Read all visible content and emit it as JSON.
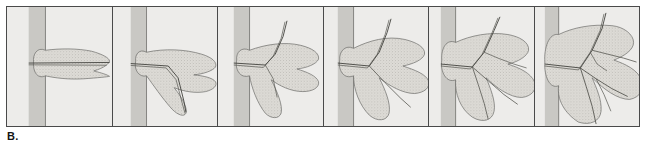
{
  "figure": {
    "caption_label": "B.",
    "panel_count": 6,
    "colors": {
      "frame_border": "#4a4a4a",
      "panel_background": "#edecea",
      "wall_band": "#c9c8c4",
      "deposit_fill": "#dcdbd6",
      "outline": "#6b6b68",
      "channel": "#55554f",
      "caption_text": "#141414"
    }
  },
  "panels": [
    {
      "index": 1,
      "name": "stage-1",
      "wall": {
        "x": 22,
        "width": 17
      },
      "outline": "M39,52 L45,50 L56,47 L70,45 L86,44 L99,44.5 L104,46 L100,48 L92,50 L80,52 L66,55 L52,57 L42,58 L39,58 Z M39,58 L46,60 L58,63 L74,66 L88,68 L99,69 L104,70.5 L98,72 L86,73 L72,73 L58,71 L46,67 L39,63 Z",
      "lobe": "M39,44 C30,40 26,49 27,56 C26,64 30,74 39,70 C48,72 62,74 78,73 C92,72 102,71 104,70.5 C102,69 96,67 88,65 C99,62 104,57 104,55 C104,52 97,48 86,45 C72,42 54,42 39,44 Z",
      "channels": [
        "M24,57 L104,56.5",
        "M24,58.5 L100,59"
      ],
      "wall_line": "M39,10 L39,118"
    },
    {
      "index": 2,
      "name": "stage-2",
      "wall": {
        "x": 18,
        "width": 16
      },
      "outline": "",
      "lobe": "M34,46 C27,42 22,48 23,55 C21,63 26,72 34,70 C40,78 50,93 60,104 C66,110 72,112 74,108 C76,103 70,92 62,82 C72,86 84,88 94,86 C102,84 106,80 104,76 C101,72 92,70 82,69 C92,68 101,65 104,61 C106,56 100,51 90,48 C74,43 52,42 34,46 Z",
      "channels": [
        "M20,58 L56,60 L66,72 L72,96 L74,107",
        "M20,59.5 L54,62 L64,74 L70,97 L73,108"
      ],
      "wall_line": "M34,10 L34,118"
    },
    {
      "index": 3,
      "name": "stage-3",
      "wall": {
        "x": 16,
        "width": 16
      },
      "outline": "",
      "lobe": "M32,44 C24,40 18,46 19,54 C17,63 22,73 32,70 C34,82 40,98 48,108 C54,114 62,114 64,108 C66,100 60,86 54,74 C62,80 74,86 86,86 C96,86 103,82 102,76 C100,70 90,66 80,63 C90,62 100,58 102,53 C103,47 96,42 84,39 C68,35 48,38 32,44 Z",
      "channels": [
        "M18,57 L48,59 L58,48 L66,30 L70,20",
        "M18,59 L46,61 L56,50 L64,32 L68,21",
        "M48,59 L56,72 L60,90"
      ],
      "wall_line": "M32,10 L32,118"
    },
    {
      "index": 4,
      "name": "stage-4",
      "wall": {
        "x": 14,
        "width": 16
      },
      "outline": "",
      "lobe": "M30,42 C22,38 15,45 16,54 C14,64 20,74 30,70 C30,84 36,100 46,110 C54,117 64,116 66,108 C68,98 62,84 56,72 C66,80 80,88 92,88 C102,87 108,82 106,75 C103,68 92,64 80,60 C90,58 100,54 102,48 C103,41 94,36 82,33 C64,29 46,34 30,42 Z",
      "channels": [
        "M16,57 L46,60 L56,46 L64,26 L68,16",
        "M16,59 L44,62 L54,48 L62,28 L66,17",
        "M46,60 L62,76 L76,92 L86,100"
      ],
      "wall_line": "M30,10 L30,118"
    },
    {
      "index": 5,
      "name": "stage-5",
      "wall": {
        "x": 12,
        "width": 15
      },
      "outline": "",
      "lobe": "M27,36 C18,32 12,42 13,54 C11,66 18,78 27,74 C26,88 32,104 44,112 C54,118 64,116 66,106 C68,96 62,82 58,72 C68,82 82,92 94,92 C104,91 110,84 107,76 C103,67 92,62 80,58 C90,56 100,50 101,44 C102,36 92,30 80,28 C62,25 42,29 27,36 Z",
      "channels": [
        "M14,58 L44,61 L56,46 L66,24 L72,14",
        "M14,60 L42,63 L54,48 L64,26 L70,15",
        "M44,61 L60,74 L76,88 L88,98",
        "M44,61 L50,78 L56,96 L60,110",
        "M56,46 L70,52 L84,58 L96,62"
      ],
      "wall_line": "M27,10 L27,118"
    },
    {
      "index": 6,
      "name": "stage-6",
      "wall": {
        "x": 10,
        "width": 14
      },
      "outline": "",
      "lobe": "M24,30 C14,28 9,42 10,56 C9,70 15,84 24,80 C22,94 30,108 44,116 C56,120 66,116 67,106 C68,94 62,82 58,72 C70,84 84,94 96,94 C106,92 112,84 108,74 C104,64 92,58 80,54 C90,50 100,44 100,36 C100,28 90,22 78,21 C58,19 38,23 24,30 Z",
      "channels": [
        "M12,58 L46,62 L58,44 L68,22 L72,10",
        "M12,60 L44,64 L56,46 L66,24 L70,11",
        "M46,62 L62,72 L78,82 L92,90",
        "M46,62 L52,80 L58,100 L62,118",
        "M58,44 L74,48 L90,52 L102,56",
        "M62,72 L70,88 L76,104",
        "M56,46 L62,58 L72,64"
      ],
      "wall_line": "M24,10 L24,118"
    }
  ]
}
